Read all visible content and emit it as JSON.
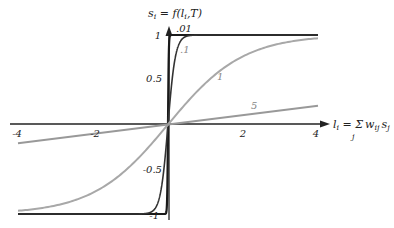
{
  "chart_data": {
    "type": "line",
    "title": "",
    "ylabel": "s_i = f(l_i, T)",
    "xlabel": "l_i = Σ_j w_ij s_j",
    "xlim": [
      -4,
      4
    ],
    "ylim": [
      -1,
      1
    ],
    "x_ticks": [
      "-4",
      "-2",
      "2",
      "4"
    ],
    "y_ticks": [
      "1",
      "0.5",
      "-0.5",
      "-1"
    ],
    "grid": false,
    "legend": "inline curve labels",
    "series": [
      {
        "name": ".01",
        "T": 0.01,
        "color": "#1a1a1a",
        "width": 2.2,
        "x": [
          -4,
          -0.2,
          -0.05,
          0,
          0.05,
          0.2,
          4
        ],
        "values": [
          -1,
          -1,
          -0.99,
          0,
          0.99,
          1,
          1
        ]
      },
      {
        "name": ".1",
        "T": 0.1,
        "color": "#333333",
        "width": 1.6,
        "x": [
          -4,
          -1,
          -0.5,
          -0.2,
          0,
          0.2,
          0.5,
          1,
          4
        ],
        "values": [
          -1,
          -1,
          -0.99,
          -0.76,
          0,
          0.76,
          0.99,
          1,
          1
        ]
      },
      {
        "name": "1",
        "T": 1,
        "color": "#a8a8a8",
        "width": 2,
        "x": [
          -4,
          -3,
          -2,
          -1,
          0,
          1,
          2,
          3,
          4
        ],
        "values": [
          -0.96,
          -0.91,
          -0.76,
          -0.46,
          0,
          0.46,
          0.76,
          0.91,
          0.96
        ]
      },
      {
        "name": "5",
        "T": 5,
        "color": "#999999",
        "width": 2,
        "x": [
          -4,
          0,
          4
        ],
        "values": [
          -0.21,
          0,
          0.21
        ]
      }
    ],
    "annotations": [
      ".01",
      ".1",
      "1",
      "5"
    ]
  },
  "axes": {
    "y_title_prefix": "s",
    "y_title_sub": "i",
    "y_title_rest": " = f(l",
    "y_title_sub2": "i",
    "y_title_end": ",T)",
    "x_title_l": "l",
    "x_title_sub": "i",
    "x_title_eq": " = ",
    "x_title_sum": "Σ",
    "x_title_sum_sub": "j",
    "x_title_w": "w",
    "x_title_w_sub": "ij",
    "x_title_s": "s",
    "x_title_s_sub": "j"
  }
}
